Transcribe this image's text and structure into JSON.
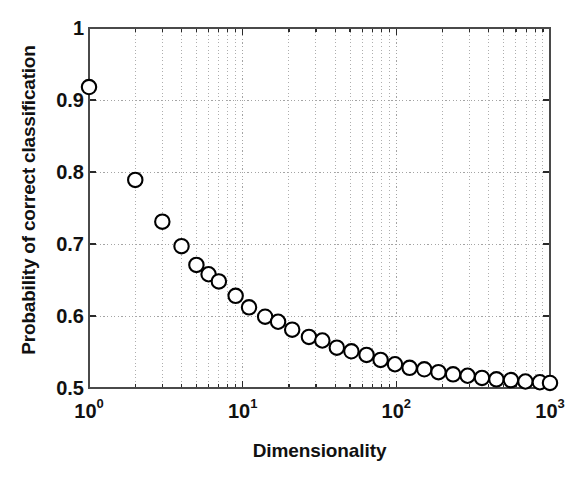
{
  "chart_data": {
    "type": "scatter",
    "title": "",
    "xlabel": "Dimensionality",
    "ylabel": "Probability of correct classification",
    "xscale": "log",
    "yscale": "linear",
    "xlim": [
      1,
      1000
    ],
    "ylim": [
      0.5,
      1.0
    ],
    "grid": true,
    "grid_style": "dotted",
    "legend": "none",
    "marker": "open-circle",
    "marker_edge_color": "#000000",
    "marker_face_color": "#ffffff",
    "xticks": [
      1,
      10,
      100,
      1000
    ],
    "xtick_labels": [
      "10⁰",
      "10¹",
      "10²",
      "10³"
    ],
    "xtick_mantissa": [
      "10",
      "10",
      "10",
      "10"
    ],
    "xtick_exponents": [
      "0",
      "1",
      "2",
      "3"
    ],
    "yticks": [
      0.5,
      0.6,
      0.7,
      0.8,
      0.9,
      1.0
    ],
    "ytick_labels": [
      "0.5",
      "0.6",
      "0.7",
      "0.8",
      "0.9",
      "1"
    ],
    "x": [
      1,
      2,
      3,
      4,
      5,
      6,
      7,
      9,
      11,
      14,
      17,
      21,
      27,
      33,
      41,
      51,
      64,
      79,
      98,
      122,
      152,
      188,
      234,
      291,
      361,
      448,
      557,
      692,
      859,
      1000
    ],
    "y": [
      0.918,
      0.789,
      0.731,
      0.697,
      0.671,
      0.658,
      0.648,
      0.628,
      0.612,
      0.599,
      0.592,
      0.581,
      0.571,
      0.566,
      0.556,
      0.551,
      0.546,
      0.539,
      0.533,
      0.528,
      0.526,
      0.522,
      0.519,
      0.517,
      0.514,
      0.512,
      0.511,
      0.509,
      0.508,
      0.507
    ],
    "series_name": "Probability of correct classification vs dimensionality",
    "axis_color": "#4a4a4a",
    "grid_color": "#9a9a9a",
    "background": "#ffffff"
  },
  "figure": {
    "plot_left_px": 89,
    "plot_right_px": 550,
    "plot_top_px": 28,
    "plot_bottom_px": 388
  }
}
